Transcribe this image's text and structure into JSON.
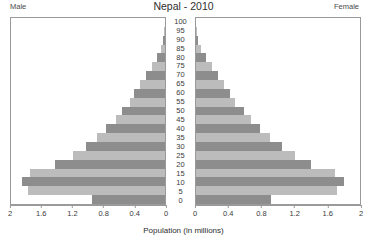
{
  "header": {
    "title": "Nepal - 2010",
    "left_label": "Male",
    "right_label": "Female"
  },
  "axis": {
    "x_title": "Population (in millions)",
    "male_ticks": [
      "2",
      "1.6",
      "1.2",
      "0.8",
      "0.4",
      "0"
    ],
    "female_ticks": [
      "0",
      "0.4",
      "0.8",
      "1.2",
      "1.6",
      "2"
    ],
    "age_ticks": [
      "0",
      "5",
      "10",
      "15",
      "20",
      "25",
      "30",
      "35",
      "40",
      "45",
      "50",
      "55",
      "60",
      "65",
      "70",
      "75",
      "80",
      "85",
      "90",
      "95",
      "100"
    ]
  },
  "colors": {
    "bar_dark": "#8d8d8d",
    "bar_light": "#bcbcbc",
    "frame": "#9a9a9a",
    "background": "#ffffff",
    "text": "#3a3a3a"
  },
  "chart_data": {
    "type": "bar",
    "title": "Nepal - 2010",
    "subtitle": "",
    "xlabel": "Population (in millions)",
    "ylabel": "Age group",
    "xlim": [
      0,
      2
    ],
    "ylim": [
      0,
      100
    ],
    "grid": false,
    "legend": "none",
    "orientation": "population-pyramid",
    "categories": [
      "0",
      "5",
      "10",
      "15",
      "20",
      "25",
      "30",
      "35",
      "40",
      "45",
      "50",
      "55",
      "60",
      "65",
      "70",
      "75",
      "80",
      "85",
      "90",
      "95",
      "100"
    ],
    "series": [
      {
        "name": "Male",
        "side": "left",
        "values": [
          0.95,
          1.78,
          1.86,
          1.75,
          1.43,
          1.2,
          1.02,
          0.88,
          0.76,
          0.64,
          0.56,
          0.46,
          0.4,
          0.32,
          0.25,
          0.17,
          0.1,
          0.05,
          0.02,
          0.01,
          0.0
        ]
      },
      {
        "name": "Female",
        "side": "right",
        "values": [
          0.92,
          1.72,
          1.8,
          1.7,
          1.4,
          1.21,
          1.05,
          0.9,
          0.78,
          0.67,
          0.58,
          0.48,
          0.42,
          0.34,
          0.27,
          0.19,
          0.12,
          0.06,
          0.03,
          0.01,
          0.0
        ]
      }
    ]
  }
}
